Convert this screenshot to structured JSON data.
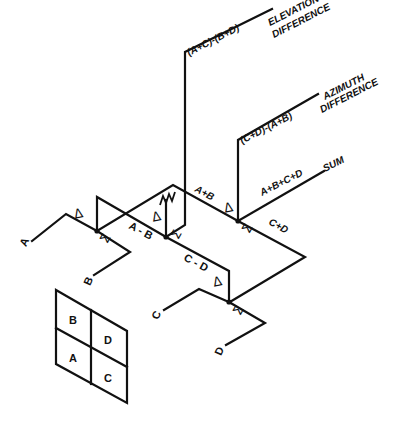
{
  "diagram": {
    "inputs": [
      "A",
      "B",
      "C",
      "D"
    ],
    "outputs": [
      {
        "expression": "(A+C)-(B+D)",
        "label_line1": "ELEVATION",
        "label_line2": "DIFFERENCE"
      },
      {
        "expression": "(C+D)-(A+B)",
        "label_line1": "AZIMUTH",
        "label_line2": "DIFFERENCE"
      },
      {
        "expression": "A+B+C+D",
        "label_line1": "SUM"
      }
    ],
    "intermediate": {
      "a_minus_b": "A - B",
      "a_plus_b": "A+B",
      "c_minus_d": "C - D",
      "c_plus_d": "C+D"
    },
    "symbols": {
      "delta": "Δ",
      "sigma": "Σ"
    },
    "horn_grid": {
      "cells": [
        [
          "B",
          "D"
        ],
        [
          "A",
          "C"
        ]
      ]
    }
  }
}
